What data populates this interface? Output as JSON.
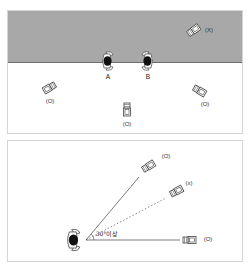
{
  "figure": {
    "title": "",
    "colors": {
      "background": "#ffffff",
      "restricted_zone": "#a8a8a8",
      "outline": "#444444",
      "head": "#111111",
      "panel_border": "#d4d4d4"
    }
  },
  "top_panel": {
    "people": [
      {
        "id": "A",
        "label": "A"
      },
      {
        "id": "B",
        "label": "B"
      }
    ],
    "cameras": [
      {
        "position": "upper-right-restricted",
        "label": "(X)",
        "allowed": false
      },
      {
        "position": "left",
        "label": "(O)",
        "allowed": true
      },
      {
        "position": "center",
        "label": "(O)",
        "allowed": true
      },
      {
        "position": "right",
        "label": "(O)",
        "allowed": true
      }
    ]
  },
  "bottom_panel": {
    "angle_label": "30°이상",
    "cameras": [
      {
        "position": "upper",
        "label": "(O)",
        "line": "solid",
        "allowed": true
      },
      {
        "position": "middle",
        "label": "(x)",
        "line": "dotted",
        "allowed": false
      },
      {
        "position": "horizontal",
        "label": "(O)",
        "line": "solid",
        "allowed": true
      }
    ]
  }
}
